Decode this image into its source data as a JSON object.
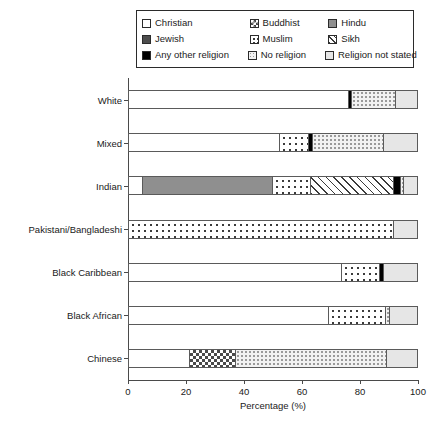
{
  "chart_data": {
    "type": "bar",
    "orientation": "horizontal",
    "stacked": true,
    "title": "",
    "xlabel": "Percentage (%)",
    "ylabel": "",
    "xlim": [
      0,
      100
    ],
    "xticks": [
      "0",
      "20",
      "40",
      "60",
      "80",
      "100"
    ],
    "grid": false,
    "legend_position": "top",
    "categories": [
      "White",
      "Mixed",
      "Indian",
      "Pakistani/Bangladeshi",
      "Black Caribbean",
      "Black African",
      "Chinese"
    ],
    "series": [
      {
        "name": "Christian",
        "pattern": "pat-christian",
        "values": [
          76.0,
          52.0,
          4.8,
          0.0,
          73.5,
          69.0,
          21.0
        ]
      },
      {
        "name": "Buddhist",
        "pattern": "pat-buddhist",
        "values": [
          0.0,
          0.0,
          0.0,
          0.0,
          0.0,
          0.0,
          16.0
        ]
      },
      {
        "name": "Hindu",
        "pattern": "pat-hindu",
        "values": [
          0.0,
          0.0,
          45.0,
          0.0,
          0.0,
          0.0,
          0.0
        ]
      },
      {
        "name": "Jewish",
        "pattern": "pat-jewish",
        "values": [
          0.0,
          0.0,
          0.0,
          0.0,
          0.0,
          0.0,
          0.0
        ]
      },
      {
        "name": "Muslim",
        "pattern": "pat-muslim",
        "values": [
          0.0,
          10.0,
          13.0,
          91.5,
          13.0,
          19.5,
          0.0
        ]
      },
      {
        "name": "Sikh",
        "pattern": "pat-sikh",
        "values": [
          0.0,
          0.0,
          28.5,
          0.0,
          0.0,
          0.0,
          0.0
        ]
      },
      {
        "name": "Any other religion",
        "pattern": "pat-other",
        "values": [
          1.0,
          1.5,
          2.5,
          0.0,
          1.5,
          0.0,
          0.0
        ]
      },
      {
        "name": "No religion",
        "pattern": "pat-noreligion",
        "values": [
          15.0,
          24.5,
          1.2,
          0.0,
          0.0,
          1.5,
          52.0
        ]
      },
      {
        "name": "Religion not stated",
        "pattern": "pat-notstated",
        "values": [
          8.0,
          12.0,
          5.0,
          8.5,
          12.0,
          10.0,
          11.0
        ]
      }
    ]
  },
  "legend": {
    "rows": [
      [
        {
          "label": "Christian",
          "pattern": "pat-christian"
        },
        {
          "label": "Buddhist",
          "pattern": "pat-buddhist"
        },
        {
          "label": "Hindu",
          "pattern": "pat-hindu"
        }
      ],
      [
        {
          "label": "Jewish",
          "pattern": "pat-jewish"
        },
        {
          "label": "Muslim",
          "pattern": "pat-muslim"
        },
        {
          "label": "Sikh",
          "pattern": "pat-sikh"
        }
      ],
      [
        {
          "label": "Any other religion",
          "pattern": "pat-other"
        },
        {
          "label": "No religion",
          "pattern": "pat-noreligion"
        },
        {
          "label": "Religion not stated",
          "pattern": "pat-notstated"
        }
      ]
    ]
  }
}
